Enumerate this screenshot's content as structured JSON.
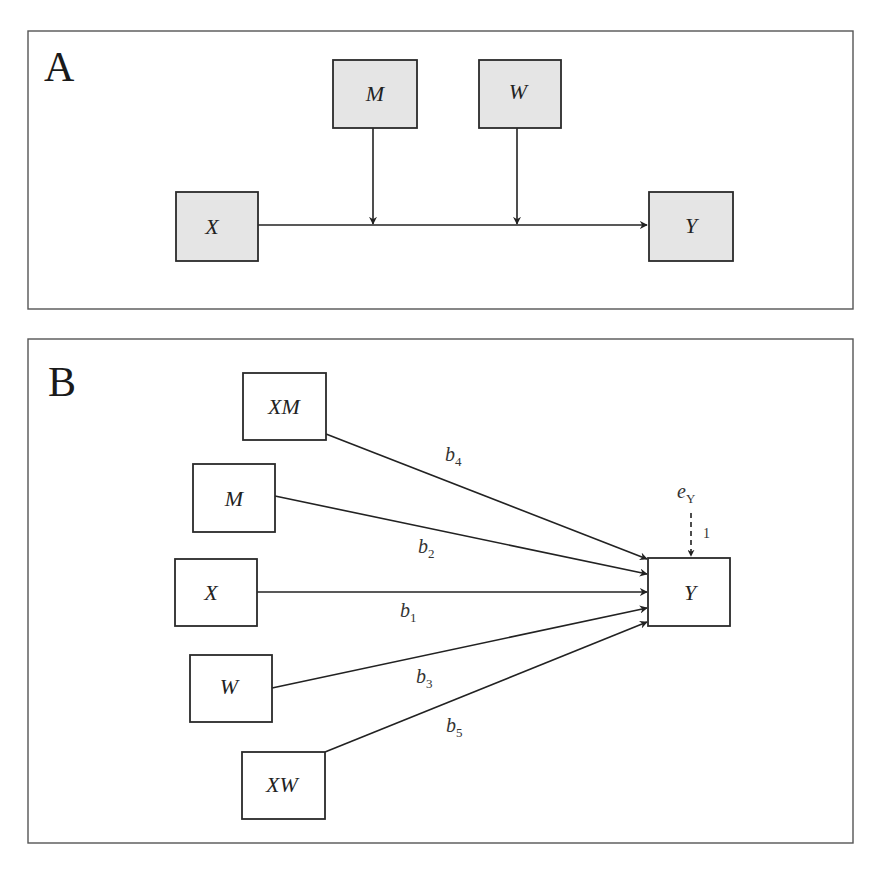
{
  "panels": {
    "A": {
      "label": "A",
      "nodes": {
        "X": "X",
        "M": "M",
        "W": "W",
        "Y": "Y"
      },
      "edges": [
        {
          "from": "X",
          "to": "Y",
          "type": "direct"
        },
        {
          "from": "M",
          "to": "X→Y path",
          "type": "moderation"
        },
        {
          "from": "W",
          "to": "X→Y path",
          "type": "moderation"
        }
      ]
    },
    "B": {
      "label": "B",
      "nodes": {
        "XM": "XM",
        "M": "M",
        "X": "X",
        "W": "W",
        "XW": "XW",
        "Y": "Y"
      },
      "coefficients": {
        "b1": {
          "base": "b",
          "sub": "1"
        },
        "b2": {
          "base": "b",
          "sub": "2"
        },
        "b3": {
          "base": "b",
          "sub": "3"
        },
        "b4": {
          "base": "b",
          "sub": "4"
        },
        "b5": {
          "base": "b",
          "sub": "5"
        }
      },
      "error": {
        "base": "e",
        "sub": "Y",
        "path_value": "1"
      },
      "edges": [
        {
          "from": "XM",
          "to": "Y",
          "coef": "b4"
        },
        {
          "from": "M",
          "to": "Y",
          "coef": "b2"
        },
        {
          "from": "X",
          "to": "Y",
          "coef": "b1"
        },
        {
          "from": "W",
          "to": "Y",
          "coef": "b3"
        },
        {
          "from": "XW",
          "to": "Y",
          "coef": "b5"
        },
        {
          "from": "eY",
          "to": "Y",
          "coef": "1",
          "style": "dashed"
        }
      ]
    }
  },
  "colors": {
    "shaded_box_fill": "#e5e5e5",
    "stroke": "#222222",
    "background": "#ffffff"
  }
}
